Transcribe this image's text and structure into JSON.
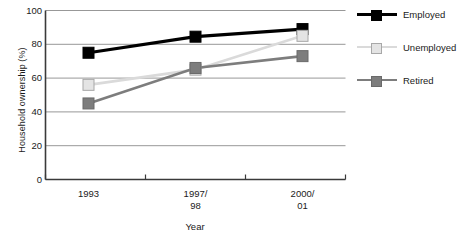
{
  "chart_data": {
    "type": "line",
    "title": "",
    "xlabel": "Year",
    "ylabel": "Household ownership (%)",
    "categories": [
      "1993",
      "1997/\n98",
      "2000/\n01"
    ],
    "category_labels_flat": [
      "1993",
      "1997/98",
      "2000/01"
    ],
    "ylim": [
      0,
      100
    ],
    "yticks": [
      0,
      20,
      40,
      60,
      80,
      100
    ],
    "ytick_labels": [
      "0",
      "20",
      "40",
      "60",
      "80",
      "100"
    ],
    "grid": true,
    "grid_axis": "y",
    "legend_position": "right",
    "marker": "square",
    "series": [
      {
        "name": "Employed",
        "values": [
          75,
          84.5,
          89
        ],
        "color": "#000000",
        "marker_fill": "#000000",
        "marker_edge": "#000000",
        "line_width": 3.2,
        "marker_size": 11
      },
      {
        "name": "Unemployed",
        "values": [
          56,
          65,
          85
        ],
        "color": "#dadada",
        "marker_fill": "#e4e4e4",
        "marker_edge": "#a8a8a8",
        "line_width": 2.6,
        "marker_size": 11
      },
      {
        "name": "Retired",
        "values": [
          45,
          66,
          73
        ],
        "color": "#7d7d7d",
        "marker_fill": "#7d7d7d",
        "marker_edge": "#6a6a6a",
        "line_width": 2.6,
        "marker_size": 11
      }
    ]
  },
  "axes": {
    "spine_color": "#3a3a3a",
    "grid_color": "#8c8c8c",
    "text_color": "#1a1a1a"
  },
  "legend": {
    "items": [
      {
        "label": "Employed"
      },
      {
        "label": "Unemployed"
      },
      {
        "label": "Retired"
      }
    ]
  }
}
